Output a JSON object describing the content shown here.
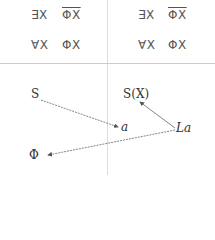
{
  "table": {
    "left": {
      "row1": {
        "a": "∃X",
        "b": "ΦX",
        "b_overline": true
      },
      "row2": {
        "a": "∀X",
        "b": "ΦX"
      }
    },
    "right": {
      "row1": {
        "a": "∃X",
        "b": "ΦX",
        "b_overline": true
      },
      "row2": {
        "a": "∀X",
        "b": "ΦX"
      }
    }
  },
  "diagram": {
    "nodes": {
      "S": "S",
      "a": "a",
      "Phi": "Φ",
      "SX": "S(X)",
      "La": "La"
    },
    "arrows": [
      {
        "from": "S",
        "to": "a"
      },
      {
        "from": "La",
        "to": "SX"
      },
      {
        "from": "La",
        "to": "Phi"
      }
    ]
  }
}
